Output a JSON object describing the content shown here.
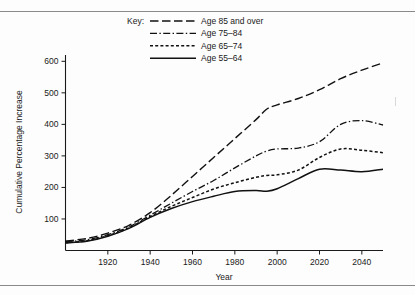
{
  "figure": {
    "name": "cumulative-percentage-increase-by-age-group",
    "background_color": "#fdfdfd",
    "line_color": "#111111",
    "rule_color": "#8a8a8a"
  },
  "axes": {
    "y_title": "Cumulative Percentage Increase",
    "x_title": "Year",
    "y_ticks": [
      100,
      200,
      300,
      400,
      500,
      600
    ],
    "x_ticks": [
      1920,
      1940,
      1960,
      1980,
      2000,
      2020,
      2040
    ]
  },
  "legend": {
    "title": "Key:",
    "position": "top-center",
    "entries": [
      {
        "label": "Age 85 and over",
        "dash": "long-dash",
        "key": "age85plus"
      },
      {
        "label": "Age 75–84",
        "dash": "dash-dot",
        "key": "age7584"
      },
      {
        "label": "Age 65–74",
        "dash": "short-dash",
        "key": "age6574"
      },
      {
        "label": "Age 55–64",
        "dash": "solid",
        "key": "age5564"
      }
    ]
  },
  "chart_data": {
    "type": "line",
    "title": "",
    "subtitle": "",
    "xlabel": "Year",
    "ylabel": "Cumulative Percentage Increase",
    "xlim": [
      1900,
      2050
    ],
    "ylim": [
      0,
      620
    ],
    "grid": false,
    "legend_position": "top-center",
    "x": [
      1900,
      1910,
      1920,
      1930,
      1940,
      1950,
      1960,
      1970,
      1980,
      1990,
      1995,
      2000,
      2010,
      2020,
      2030,
      2040,
      2050
    ],
    "series": [
      {
        "name": "Age 85 and over",
        "dash": "long-dash",
        "values": [
          30,
          38,
          55,
          80,
          120,
          175,
          235,
          295,
          355,
          415,
          448,
          462,
          482,
          510,
          545,
          572,
          595
        ]
      },
      {
        "name": "Age 75–84",
        "dash": "dash-dot",
        "values": [
          28,
          34,
          50,
          75,
          112,
          150,
          187,
          222,
          262,
          300,
          315,
          322,
          325,
          345,
          400,
          412,
          398
        ]
      },
      {
        "name": "Age 65–74",
        "dash": "short-dash",
        "values": [
          25,
          31,
          47,
          72,
          108,
          140,
          168,
          195,
          215,
          232,
          238,
          240,
          255,
          295,
          322,
          318,
          310
        ]
      },
      {
        "name": "Age 55–64",
        "dash": "solid",
        "values": [
          24,
          29,
          45,
          70,
          105,
          133,
          155,
          172,
          187,
          190,
          188,
          196,
          228,
          258,
          255,
          250,
          258
        ]
      }
    ]
  }
}
